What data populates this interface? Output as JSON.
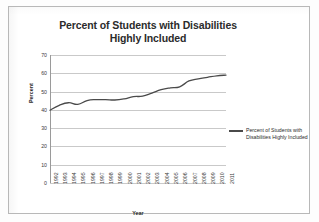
{
  "chart_data": {
    "type": "line",
    "title": "Percent of Students with Disabilities Highly Included",
    "title_line1": "Percent of Students with Disabilities",
    "title_line2": "Highly Included",
    "xlabel": "Year",
    "ylabel": "Percent",
    "ylim": [
      0,
      70
    ],
    "yticks": [
      70,
      60,
      50,
      40,
      30,
      20,
      10,
      0
    ],
    "grid": true,
    "legend_position": "right",
    "line_color": "#4a4a4a",
    "grid_color": "#c9c9c9",
    "categories": [
      "1992",
      "1993",
      "1994",
      "1995",
      "1996",
      "1997",
      "1998",
      "1999",
      "2000",
      "2001",
      "2002",
      "2003",
      "2004",
      "2005",
      "2006",
      "2007",
      "2008",
      "2009",
      "2010",
      "2011"
    ],
    "series": [
      {
        "name": "Percent of Students with Disabilities Highly Included",
        "values": [
          39.8,
          42.5,
          43.9,
          43.0,
          45.1,
          45.6,
          45.6,
          45.4,
          46.0,
          47.2,
          47.5,
          49.2,
          51.0,
          52.0,
          52.6,
          55.8,
          57.0,
          57.8,
          58.6,
          59.0
        ]
      }
    ],
    "legend": [
      "Percent of Students with Disabilities Highly Included"
    ]
  }
}
